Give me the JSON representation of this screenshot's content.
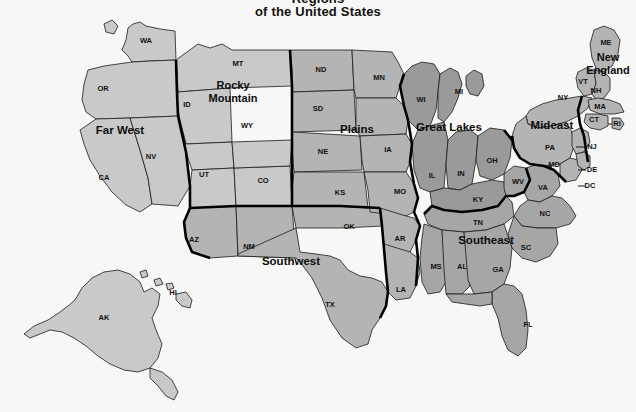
{
  "title": {
    "line1_partial": "Regions",
    "line2": "of the United States"
  },
  "map": {
    "name": "us-economic-regions-map",
    "background_color": "#f7f7f5",
    "border_color": "#1a1a1a",
    "fills": {
      "light": "#c9c9c9",
      "mid": "#b4b4b4",
      "dark": "#9a9a9a"
    }
  },
  "regions": [
    {
      "id": "far-west",
      "label": "Far West",
      "x": 120,
      "y": 131,
      "lines": [
        "Far West"
      ]
    },
    {
      "id": "rocky-mountain",
      "label": "Rocky Mountain",
      "x": 233,
      "y": 92,
      "lines": [
        "Rocky",
        "Mountain"
      ]
    },
    {
      "id": "southwest",
      "label": "Southwest",
      "x": 291,
      "y": 262,
      "lines": [
        "Southwest"
      ]
    },
    {
      "id": "plains",
      "label": "Plains",
      "x": 357,
      "y": 130,
      "lines": [
        "Plains"
      ]
    },
    {
      "id": "great-lakes",
      "label": "Great Lakes",
      "x": 449,
      "y": 128,
      "lines": [
        "Great Lakes"
      ]
    },
    {
      "id": "southeast",
      "label": "Southeast",
      "x": 486,
      "y": 241,
      "lines": [
        "Southeast"
      ]
    },
    {
      "id": "mideast",
      "label": "Mideast",
      "x": 552,
      "y": 126,
      "lines": [
        "Mideast"
      ]
    },
    {
      "id": "new-england",
      "label": "New England",
      "x": 608,
      "y": 64,
      "lines": [
        "New",
        "England"
      ]
    }
  ],
  "states": [
    {
      "abbr": "WA",
      "x": 146,
      "y": 41,
      "region": "far-west"
    },
    {
      "abbr": "OR",
      "x": 103,
      "y": 89,
      "region": "far-west"
    },
    {
      "abbr": "CA",
      "x": 104,
      "y": 178,
      "region": "far-west"
    },
    {
      "abbr": "NV",
      "x": 151,
      "y": 157,
      "region": "far-west"
    },
    {
      "abbr": "AK",
      "x": 104,
      "y": 318,
      "region": "far-west"
    },
    {
      "abbr": "HI",
      "x": 173,
      "y": 293,
      "region": "far-west"
    },
    {
      "abbr": "MT",
      "x": 238,
      "y": 64,
      "region": "rocky-mountain"
    },
    {
      "abbr": "ID",
      "x": 187,
      "y": 105,
      "region": "rocky-mountain"
    },
    {
      "abbr": "WY",
      "x": 247,
      "y": 126,
      "region": "rocky-mountain"
    },
    {
      "abbr": "UT",
      "x": 204,
      "y": 175,
      "region": "rocky-mountain"
    },
    {
      "abbr": "CO",
      "x": 263,
      "y": 181,
      "region": "rocky-mountain"
    },
    {
      "abbr": "AZ",
      "x": 194,
      "y": 240,
      "region": "southwest"
    },
    {
      "abbr": "NM",
      "x": 249,
      "y": 247,
      "region": "southwest"
    },
    {
      "abbr": "TX",
      "x": 330,
      "y": 305,
      "region": "southwest"
    },
    {
      "abbr": "OK",
      "x": 349,
      "y": 227,
      "region": "southwest"
    },
    {
      "abbr": "ND",
      "x": 321,
      "y": 70,
      "region": "plains"
    },
    {
      "abbr": "SD",
      "x": 318,
      "y": 109,
      "region": "plains"
    },
    {
      "abbr": "NE",
      "x": 323,
      "y": 152,
      "region": "plains"
    },
    {
      "abbr": "KS",
      "x": 340,
      "y": 193,
      "region": "plains"
    },
    {
      "abbr": "MN",
      "x": 379,
      "y": 78,
      "region": "plains"
    },
    {
      "abbr": "IA",
      "x": 388,
      "y": 150,
      "region": "plains"
    },
    {
      "abbr": "MO",
      "x": 400,
      "y": 192,
      "region": "plains"
    },
    {
      "abbr": "AR",
      "x": 400,
      "y": 239,
      "region": "plains"
    },
    {
      "abbr": "LA",
      "x": 401,
      "y": 290,
      "region": "plains"
    },
    {
      "abbr": "WI",
      "x": 421,
      "y": 100,
      "region": "great-lakes"
    },
    {
      "abbr": "MI",
      "x": 459,
      "y": 92,
      "region": "great-lakes"
    },
    {
      "abbr": "IL",
      "x": 432,
      "y": 176,
      "region": "great-lakes"
    },
    {
      "abbr": "IN",
      "x": 461,
      "y": 174,
      "region": "great-lakes"
    },
    {
      "abbr": "OH",
      "x": 492,
      "y": 161,
      "region": "great-lakes"
    },
    {
      "abbr": "KY",
      "x": 478,
      "y": 200,
      "region": "great-lakes"
    },
    {
      "abbr": "TN",
      "x": 478,
      "y": 223,
      "region": "southeast"
    },
    {
      "abbr": "MS",
      "x": 436,
      "y": 267,
      "region": "southeast"
    },
    {
      "abbr": "AL",
      "x": 462,
      "y": 267,
      "region": "southeast"
    },
    {
      "abbr": "GA",
      "x": 498,
      "y": 270,
      "region": "southeast"
    },
    {
      "abbr": "SC",
      "x": 526,
      "y": 248,
      "region": "southeast"
    },
    {
      "abbr": "NC",
      "x": 545,
      "y": 214,
      "region": "southeast"
    },
    {
      "abbr": "VA",
      "x": 543,
      "y": 188,
      "region": "southeast"
    },
    {
      "abbr": "WV",
      "x": 518,
      "y": 182,
      "region": "southeast"
    },
    {
      "abbr": "FL",
      "x": 528,
      "y": 325,
      "region": "southeast"
    },
    {
      "abbr": "NY",
      "x": 563,
      "y": 98,
      "region": "mideast"
    },
    {
      "abbr": "PA",
      "x": 550,
      "y": 148,
      "region": "mideast"
    },
    {
      "abbr": "MD",
      "x": 554,
      "y": 165,
      "region": "mideast"
    },
    {
      "abbr": "NJ",
      "x": 592,
      "y": 147,
      "region": "mideast"
    },
    {
      "abbr": "DE",
      "x": 592,
      "y": 170,
      "region": "mideast"
    },
    {
      "abbr": "DC",
      "x": 590,
      "y": 186,
      "region": "mideast"
    },
    {
      "abbr": "ME",
      "x": 606,
      "y": 43,
      "region": "new-england"
    },
    {
      "abbr": "VT",
      "x": 583,
      "y": 82,
      "region": "new-england"
    },
    {
      "abbr": "NH",
      "x": 596,
      "y": 91,
      "region": "new-england"
    },
    {
      "abbr": "MA",
      "x": 600,
      "y": 107,
      "region": "new-england"
    },
    {
      "abbr": "CT",
      "x": 594,
      "y": 120,
      "region": "new-england"
    },
    {
      "abbr": "RI",
      "x": 617,
      "y": 124,
      "region": "new-england"
    }
  ]
}
